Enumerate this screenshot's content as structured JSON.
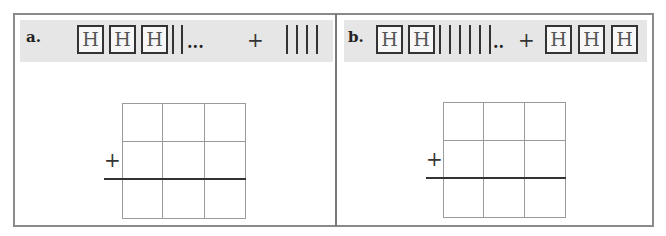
{
  "panels": [
    {
      "label": "a.",
      "expression": {
        "left_operand": {
          "hundreds": 3,
          "tens": 2,
          "ones_marker": "..."
        },
        "operator": "+",
        "right_operand": {
          "hundreds": 0,
          "tens": 4,
          "ones_marker": ""
        }
      },
      "hundreds_glyph": "H",
      "grid": {
        "rows": 3,
        "cols": 3,
        "plus_sign": "+",
        "sum_line_after_row": 2
      }
    },
    {
      "label": "b.",
      "expression": {
        "left_operand": {
          "hundreds": 2,
          "tens": 6,
          "ones_marker": ".."
        },
        "operator": "+",
        "right_operand": {
          "hundreds": 3,
          "tens": 0,
          "ones_marker": ""
        }
      },
      "hundreds_glyph": "H",
      "grid": {
        "rows": 3,
        "cols": 3,
        "plus_sign": "+",
        "sum_line_after_row": 2
      }
    }
  ],
  "colors": {
    "band": "#e6e6e6",
    "frame": "#8a8a8a",
    "grid": "#9a9a9a",
    "ink": "#333333"
  }
}
